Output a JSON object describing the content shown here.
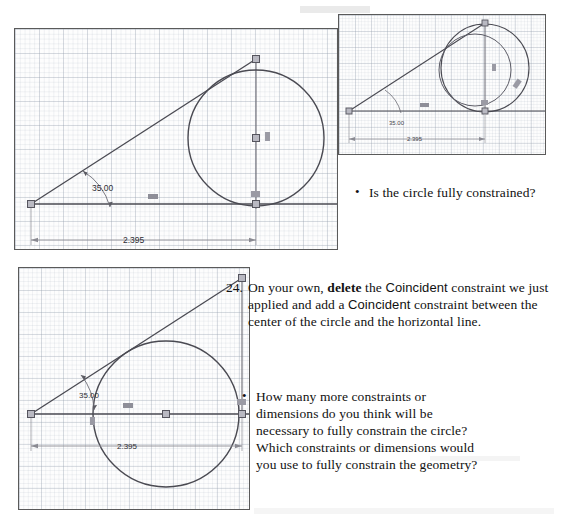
{
  "document": {
    "type": "textbook-exercise-page",
    "figure_dimension_label": "2.395",
    "figure_angle_label": "35.00"
  },
  "figures": {
    "top_left": {
      "name": "sketch-circle-tangent-unconstrained",
      "angle": "35.00",
      "dimension": "2.395",
      "description": "Sketch with inclined line at 35.00 degrees, horizontal line, and circle tangent to the inclined line; vertical construction line through circle center."
    },
    "top_right": {
      "name": "sketch-circle-dragged",
      "angle": "35.00",
      "dimension": "2.395",
      "description": "Same sketch shown smaller with the circle dragged, showing two overlapping circle positions."
    },
    "bottom_left": {
      "name": "sketch-circle-center-coincident-horizontal",
      "angle": "35.00",
      "dimension": "2.395",
      "description": "Sketch after adding a Coincident constraint between the circle center and the horizontal line."
    }
  },
  "content": {
    "question_1": {
      "bullet": "•",
      "text": "Is the circle fully constrained?"
    },
    "step_24": {
      "number": "24.",
      "part_1": "On your own, ",
      "bold": "delete",
      "part_2": " the ",
      "coincident_1": "Coincident",
      "part_3": " constraint we just applied and add a ",
      "coincident_2": "Coincident",
      "part_4": " constraint between the center of the circle and the horizontal line."
    },
    "question_2": {
      "bullet": "•",
      "line_1": "How many more constraints or",
      "line_2": "dimensions do you think will be",
      "line_3": "necessary to fully constrain the circle?",
      "line_4": "Which constraints or dimensions would",
      "line_5": "you use to fully constrain the geometry?"
    }
  },
  "colors": {
    "geometry_line": "#4a4a52",
    "dimension_line": "#8a8a92",
    "grid_line": "#96a0af",
    "frame_border": "#5a5a5a",
    "frame_shadow": "#9b9b9b",
    "text": "#111111",
    "page_background": "#ffffff"
  }
}
